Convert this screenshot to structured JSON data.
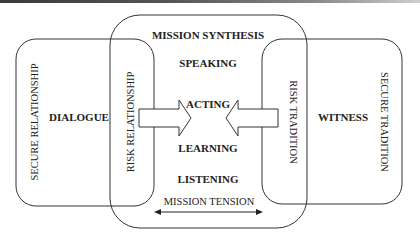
{
  "diagram": {
    "title": "MISSION SYNTHESIS",
    "left_box": {
      "outer_label": "SECURE RELATIONSHIP",
      "main_label": "DIALOGUE",
      "inner_label": "RISK RELATIONSHIP"
    },
    "right_box": {
      "outer_label": "SECURE TRADITION",
      "main_label": "WITNESS",
      "inner_label": "RISK TRADITION"
    },
    "center_box": {
      "items": [
        "SPEAKING",
        "ACTING",
        "LEARNING",
        "LISTENING"
      ],
      "tension_label": "MISSION TENSION"
    },
    "arrows": {
      "left_arrow": "right-pointing block arrow",
      "right_arrow": "left-pointing block arrow",
      "tension_arrow": "double-headed arrow"
    },
    "colors": {
      "stroke": "#333333",
      "text": "#222222",
      "background": "#ffffff"
    }
  }
}
